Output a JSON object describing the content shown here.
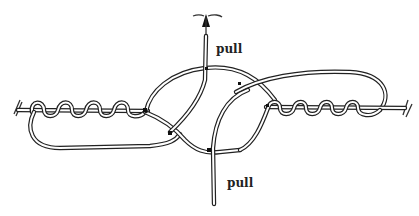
{
  "diagram": {
    "labels": {
      "pull_top": "pull",
      "pull_bottom": "pull"
    },
    "elements": [
      {
        "name": "left-standing-line",
        "description": "line entering from left with cut end"
      },
      {
        "name": "left-wraps",
        "count": 4,
        "description": "coils wrapped around left line"
      },
      {
        "name": "right-standing-line",
        "description": "line exiting to right with cut end"
      },
      {
        "name": "right-wraps",
        "count": 4,
        "description": "coils wrapped around right line"
      },
      {
        "name": "top-tag-end",
        "description": "end pulled upward with arrow"
      },
      {
        "name": "bottom-tag-end",
        "description": "end pulled downward"
      }
    ],
    "colors": {
      "ink": "#222222",
      "background": "#ffffff"
    }
  }
}
